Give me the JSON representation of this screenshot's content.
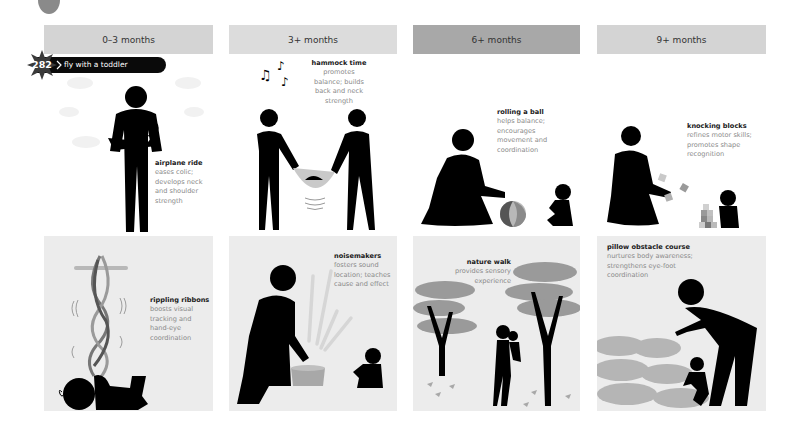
{
  "page": {
    "badge": {
      "number": "282",
      "label": "fly with a toddler"
    },
    "columns": [
      {
        "header": "0–3 months",
        "header_color": "#d4d4d4"
      },
      {
        "header": "3+ months",
        "header_color": "#dcdcdc"
      },
      {
        "header": "6+ months",
        "header_color": "#a8a8a8"
      },
      {
        "header": "9+ months",
        "header_color": "#d4d4d4"
      }
    ],
    "activities": [
      {
        "title": "airplane ride",
        "description": "eases colic; develops neck and shoulder strength",
        "lines": [
          "eases colic;",
          "develops neck",
          "and shoulder",
          "strength"
        ]
      },
      {
        "title": "hammock time",
        "description": "promotes balance; builds back and neck strength",
        "lines": [
          "promotes",
          "balance; builds",
          "back and neck",
          "strength"
        ]
      },
      {
        "title": "rolling a ball",
        "description": "helps balance; encourages movement and coordination",
        "lines": [
          "helps balance;",
          "encourages",
          "movement and",
          "coordination"
        ]
      },
      {
        "title": "knocking blocks",
        "description": "refines motor skills; promotes shape recognition",
        "lines": [
          "refines motor skills;",
          "promotes shape",
          "recognition"
        ]
      },
      {
        "title": "rippling ribbons",
        "description": "boosts visual tracking and hand-eye coordination",
        "lines": [
          "boosts visual",
          "tracking and",
          "hand-eye",
          "coordination"
        ]
      },
      {
        "title": "noisemakers",
        "description": "fosters sound location; teaches cause and effect",
        "lines": [
          "fosters sound",
          "location; teaches",
          "cause and effect"
        ]
      },
      {
        "title": "nature walk",
        "description": "provides sensory experience",
        "lines": [
          "provides sensory",
          "experience"
        ]
      },
      {
        "title": "pillow obstacle course",
        "description": "nurtures body awareness; strengthens eye-foot coordination",
        "lines": [
          "nurtures body awareness;",
          "strengthens eye-foot",
          "coordination"
        ]
      }
    ],
    "colors": {
      "figure": "#000000",
      "accent_gray": "#a0a0a0",
      "panel_bg": "#ececec"
    }
  }
}
